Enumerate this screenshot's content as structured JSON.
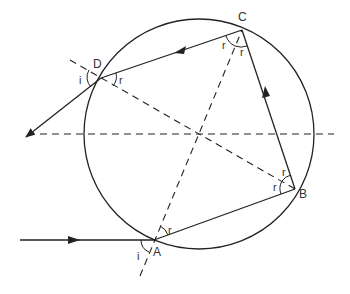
{
  "diagram": {
    "colors": {
      "stroke": "#222222",
      "text": "#333333",
      "background": "#ffffff"
    },
    "circle": {
      "cx": 199,
      "cy": 134,
      "r": 115
    },
    "points": {
      "A": {
        "label": "A",
        "x": 154,
        "y": 240
      },
      "B": {
        "label": "B",
        "x": 295,
        "y": 189
      },
      "C": {
        "label": "C",
        "x": 242,
        "y": 30
      },
      "D": {
        "label": "D",
        "x": 101,
        "y": 78
      }
    },
    "angle_labels": {
      "A_i": "i",
      "A_r": "r",
      "B_r1": "r",
      "B_r2": "r",
      "C_r1": "r",
      "C_r2": "r",
      "D_i": "i",
      "D_r": "r"
    },
    "rays": [
      {
        "name": "incident-ray",
        "from": "external-left",
        "to": "A",
        "arrow": "right"
      },
      {
        "name": "ray-A-B",
        "from": "A",
        "to": "B"
      },
      {
        "name": "ray-B-C",
        "from": "B",
        "to": "C",
        "arrow": "up"
      },
      {
        "name": "ray-C-D",
        "from": "C",
        "to": "D",
        "arrow": "left"
      },
      {
        "name": "emergent-ray",
        "from": "D",
        "to": "external-lower-left",
        "arrow": "down-left"
      }
    ],
    "normals": [
      {
        "name": "normal-A-C",
        "style": "dashed"
      },
      {
        "name": "normal-D-B",
        "style": "dashed"
      },
      {
        "name": "horizontal-axis",
        "style": "dashed"
      }
    ]
  }
}
